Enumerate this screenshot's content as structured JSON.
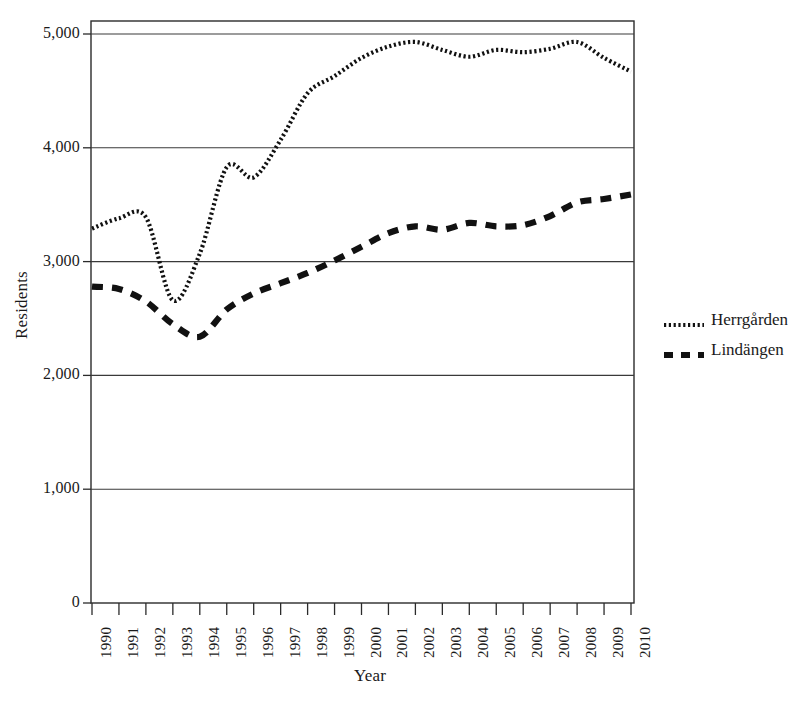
{
  "chart_data": {
    "type": "line",
    "title": "",
    "xlabel": "Year",
    "ylabel": "Residents",
    "grid": true,
    "legend_position": "right",
    "x": [
      1990,
      1991,
      1992,
      1993,
      1994,
      1995,
      1996,
      1997,
      1998,
      1999,
      2000,
      2001,
      2002,
      2003,
      2004,
      2005,
      2006,
      2007,
      2008,
      2009,
      2010
    ],
    "categories": [
      "1990",
      "1991",
      "1992",
      "1993",
      "1994",
      "1995",
      "1996",
      "1997",
      "1998",
      "1999",
      "2000",
      "2001",
      "2002",
      "2003",
      "2004",
      "2005",
      "2006",
      "2007",
      "2008",
      "2009",
      "2010"
    ],
    "xlim": [
      1990,
      2010
    ],
    "ylim": [
      0,
      5100
    ],
    "ytick_labels": [
      "5,000",
      "4,000",
      "3,000",
      "2,000",
      "1,000",
      "0"
    ],
    "ytick_values": [
      5000,
      4000,
      3000,
      2000,
      1000,
      0
    ],
    "series": [
      {
        "name": "Herrgården",
        "style": "dotted",
        "color": "#111111",
        "values": [
          3290,
          3380,
          3390,
          2660,
          3070,
          3830,
          3740,
          4070,
          4480,
          4630,
          4790,
          4890,
          4930,
          4860,
          4800,
          4860,
          4840,
          4870,
          4930,
          4790,
          4670
        ]
      },
      {
        "name": "Lindängen",
        "style": "dashed",
        "color": "#111111",
        "values": [
          2780,
          2760,
          2650,
          2450,
          2340,
          2580,
          2720,
          2810,
          2900,
          3010,
          3130,
          3250,
          3310,
          3280,
          3340,
          3310,
          3320,
          3400,
          3520,
          3550,
          3590
        ]
      }
    ]
  },
  "legend": {
    "entries": [
      {
        "label": "Herrgården",
        "marker": "dotted-line-swatch"
      },
      {
        "label": "Lindängen",
        "marker": "dashed-line-swatch"
      }
    ]
  },
  "axes": {
    "y_title": "Residents",
    "x_title": "Year"
  }
}
